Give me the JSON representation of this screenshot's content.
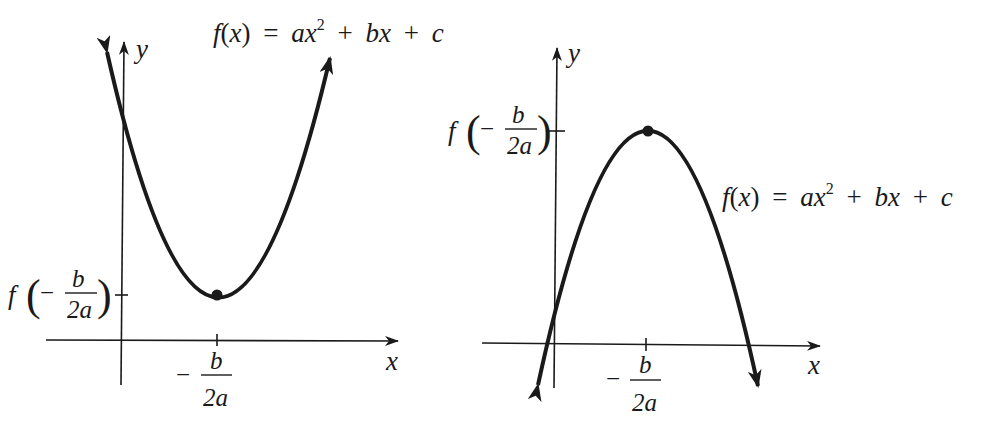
{
  "figure": {
    "left_graph": {
      "description": "Parabola opening upward (a > 0), vertex is a minimum",
      "function_label": {
        "f": "f",
        "open": "(",
        "x": "x",
        "close": ")",
        "eq": "=",
        "a": "a",
        "x2": "x",
        "exp": "2",
        "plus1": "+",
        "b": "b",
        "x1": "x",
        "plus2": "+",
        "c": "c"
      },
      "x_axis_label": "x",
      "y_axis_label": "y",
      "x_tick_label": {
        "minus": "−",
        "numerator": "b",
        "denominator": "2a"
      },
      "y_tick_label": {
        "f": "f",
        "minus": "−",
        "numerator": "b",
        "denominator": "2a"
      },
      "vertex_type": "minimum"
    },
    "right_graph": {
      "description": "Parabola opening downward (a < 0), vertex is a maximum",
      "function_label": {
        "f": "f",
        "open": "(",
        "x": "x",
        "close": ")",
        "eq": "=",
        "a": "a",
        "x2": "x",
        "exp": "2",
        "plus1": "+",
        "b": "b",
        "x1": "x",
        "plus2": "+",
        "c": "c"
      },
      "x_axis_label": "x",
      "y_axis_label": "y",
      "x_tick_label": {
        "minus": "−",
        "numerator": "b",
        "denominator": "2a"
      },
      "y_tick_label": {
        "f": "f",
        "minus": "−",
        "numerator": "b",
        "denominator": "2a"
      },
      "vertex_type": "maximum"
    },
    "colors": {
      "ink": "#1a1a1a",
      "background": "#ffffff"
    }
  }
}
